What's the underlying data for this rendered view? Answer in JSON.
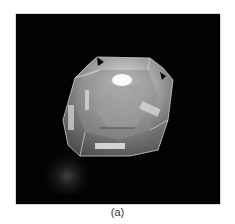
{
  "figure": {
    "caption": "(a)",
    "background_color": "#030303"
  }
}
